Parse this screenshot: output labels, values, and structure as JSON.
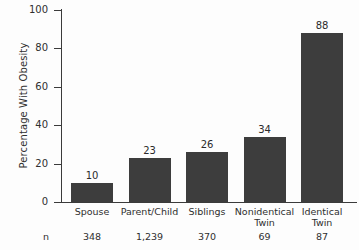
{
  "chart_data": {
    "type": "bar",
    "title": "",
    "xlabel": "",
    "ylabel": "Percentage With Obesity",
    "ylim": [
      0,
      100
    ],
    "ytick_labels": [
      "0",
      "20",
      "40",
      "60",
      "80",
      "100"
    ],
    "ytick_values": [
      0,
      20,
      40,
      60,
      80,
      100
    ],
    "grid": false,
    "legend": "none",
    "bar_color": "#3d3d3d",
    "categories": [
      "Spouse",
      "Parent/Child",
      "Siblings",
      "Nonidentical Twin",
      "Identical Twin"
    ],
    "values": [
      10,
      23,
      26,
      34,
      88
    ],
    "value_labels": [
      "10",
      "23",
      "26",
      "34",
      "88"
    ],
    "sample_size_row_label": "n",
    "sample_sizes": [
      "348",
      "1,239",
      "370",
      "69",
      "87"
    ],
    "category_lines": [
      [
        "Spouse"
      ],
      [
        "Parent/Child"
      ],
      [
        "Siblings"
      ],
      [
        "Nonidentical",
        "Twin"
      ],
      [
        "Identical",
        "Twin"
      ]
    ]
  }
}
